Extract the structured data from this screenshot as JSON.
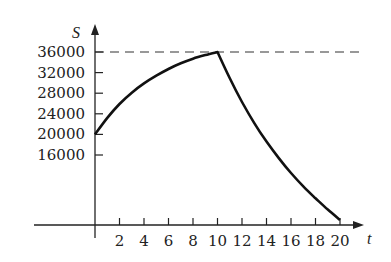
{
  "chart_data": {
    "type": "line",
    "title": "",
    "xlabel": "t",
    "ylabel": "S",
    "x_ticks": [
      2,
      4,
      6,
      8,
      10,
      12,
      14,
      16,
      18,
      20
    ],
    "x_tick_labels": [
      "2",
      "4",
      "6",
      "8",
      "10",
      "12",
      "14",
      "16",
      "18",
      "20"
    ],
    "y_ticks": [
      16000,
      20000,
      24000,
      28000,
      32000,
      36000
    ],
    "y_tick_labels": [
      "16000",
      "20000",
      "24000",
      "28000",
      "32000",
      "36000"
    ],
    "xlim": [
      0,
      21
    ],
    "ylim": [
      2400,
      38000
    ],
    "grid": false,
    "reference_lines": [
      {
        "type": "horizontal",
        "y": 36000,
        "style": "dashed"
      }
    ],
    "series": [
      {
        "name": "S(t)",
        "x": [
          0,
          1,
          2,
          3,
          4,
          5,
          6,
          7,
          8,
          9,
          10,
          11,
          12,
          13,
          14,
          15,
          16,
          17,
          18,
          19,
          20
        ],
        "values": [
          20000,
          23200,
          25900,
          28100,
          29900,
          31400,
          32700,
          33800,
          34700,
          35400,
          36000,
          30900,
          26300,
          22200,
          18600,
          15400,
          12500,
          9900,
          7600,
          5400,
          3400
        ]
      }
    ]
  }
}
